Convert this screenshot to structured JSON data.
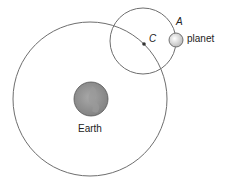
{
  "labels": {
    "point_a": "A",
    "point_c": "C",
    "planet": "planet",
    "earth": "Earth"
  },
  "colors": {
    "orbit_stroke": "#6e6e6e",
    "earth_fill": "#8c8c8c",
    "planet_fill": "#e6e6e6"
  }
}
